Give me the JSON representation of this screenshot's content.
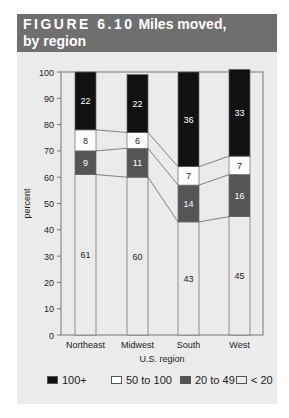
{
  "figure": {
    "label": "FIGURE 6.10",
    "title_line1": "Miles moved,",
    "title_line2": "by region"
  },
  "colors": {
    "header_bg": "#6f6f6f",
    "panel_bg": "#ebebeb",
    "100+": "#111111",
    "50 to 100": "#ffffff",
    "20 to 49": "#555555",
    "< 20": "#ebebeb"
  },
  "legend": [
    {
      "label": "100+",
      "color": "#111111"
    },
    {
      "label": "50 to 100",
      "color": "#ffffff"
    },
    {
      "label": "20 to 49",
      "color": "#555555"
    },
    {
      "label": "< 20",
      "color": "#ebebeb"
    }
  ],
  "chart_data": {
    "type": "bar",
    "stacked": true,
    "title": "Miles moved, by region",
    "xlabel": "U.S. region",
    "ylabel": "percent",
    "ylim": [
      0,
      100
    ],
    "yticks": [
      0,
      10,
      20,
      30,
      40,
      50,
      60,
      70,
      80,
      90,
      100
    ],
    "categories": [
      "Northeast",
      "Midwest",
      "South",
      "West"
    ],
    "series": [
      {
        "name": "< 20",
        "values": [
          61,
          60,
          43,
          45
        ]
      },
      {
        "name": "20 to 49",
        "values": [
          9,
          11,
          14,
          16
        ]
      },
      {
        "name": "50 to 100",
        "values": [
          8,
          6,
          7,
          7
        ]
      },
      {
        "name": "100+",
        "values": [
          22,
          22,
          36,
          33
        ]
      }
    ],
    "legend_position": "bottom",
    "connector_lines": true,
    "grid": false
  }
}
